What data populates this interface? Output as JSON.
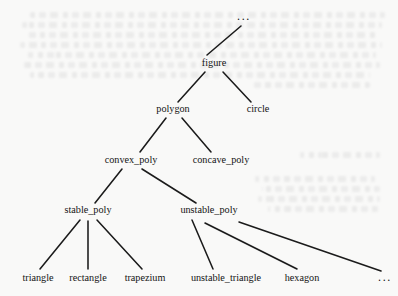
{
  "diagram": {
    "type": "tree",
    "background_color": "#f9f9f8",
    "edge_color": "#1b1b1b",
    "text_color": "#141414",
    "width": 398,
    "height": 296,
    "nodes": [
      {
        "id": "root_ellipsis",
        "label": "...",
        "x": 244,
        "y": 20,
        "level": 0,
        "is_ellipsis": true,
        "half_width": 9
      },
      {
        "id": "figure",
        "label": "figure",
        "x": 214,
        "y": 66,
        "level": 1,
        "is_ellipsis": false,
        "half_width": 17
      },
      {
        "id": "polygon",
        "label": "polygon",
        "x": 173,
        "y": 112,
        "level": 2,
        "is_ellipsis": false,
        "half_width": 22
      },
      {
        "id": "circle",
        "label": "circle",
        "x": 258,
        "y": 112,
        "level": 2,
        "is_ellipsis": false,
        "half_width": 16
      },
      {
        "id": "convex_poly",
        "label": "convex_poly",
        "x": 131,
        "y": 163,
        "level": 3,
        "is_ellipsis": false,
        "half_width": 32
      },
      {
        "id": "concave_poly",
        "label": "concave_poly",
        "x": 221,
        "y": 163,
        "level": 3,
        "is_ellipsis": false,
        "half_width": 34
      },
      {
        "id": "stable_poly",
        "label": "stable_poly",
        "x": 88,
        "y": 213,
        "level": 4,
        "is_ellipsis": false,
        "half_width": 29
      },
      {
        "id": "unstable_poly",
        "label": "unstable_poly",
        "x": 209,
        "y": 213,
        "level": 4,
        "is_ellipsis": false,
        "half_width": 34
      },
      {
        "id": "triangle",
        "label": "triangle",
        "x": 38,
        "y": 281,
        "level": 5,
        "is_ellipsis": false,
        "half_width": 20
      },
      {
        "id": "rectangle",
        "label": "rectangle",
        "x": 88,
        "y": 281,
        "level": 5,
        "is_ellipsis": false,
        "half_width": 24
      },
      {
        "id": "trapezium",
        "label": "trapezium",
        "x": 145,
        "y": 281,
        "level": 5,
        "is_ellipsis": false,
        "half_width": 24
      },
      {
        "id": "unstable_triangle",
        "label": "unstable_triangle",
        "x": 226,
        "y": 281,
        "level": 5,
        "is_ellipsis": false,
        "half_width": 42
      },
      {
        "id": "hexagon",
        "label": "hexagon",
        "x": 302,
        "y": 281,
        "level": 5,
        "is_ellipsis": false,
        "half_width": 22
      },
      {
        "id": "leaf_ellipsis",
        "label": "...",
        "x": 385,
        "y": 281,
        "level": 5,
        "is_ellipsis": true,
        "half_width": 9
      }
    ],
    "edges": [
      {
        "id": "edge-figure-root",
        "from": "figure",
        "to": "root_ellipsis",
        "x1": 207,
        "y1": 55,
        "x2": 241,
        "y2": 26
      },
      {
        "id": "edge-figure-polygon",
        "from": "figure",
        "to": "polygon",
        "x1": 205,
        "y1": 72,
        "x2": 178,
        "y2": 102
      },
      {
        "id": "edge-figure-circle",
        "from": "figure",
        "to": "circle",
        "x1": 223,
        "y1": 72,
        "x2": 251,
        "y2": 102
      },
      {
        "id": "edge-polygon-convex",
        "from": "polygon",
        "to": "convex_poly",
        "x1": 166,
        "y1": 118,
        "x2": 140,
        "y2": 152
      },
      {
        "id": "edge-polygon-concave",
        "from": "polygon",
        "to": "concave_poly",
        "x1": 182,
        "y1": 118,
        "x2": 211,
        "y2": 152
      },
      {
        "id": "edge-convex-stable",
        "from": "convex_poly",
        "to": "stable_poly",
        "x1": 122,
        "y1": 169,
        "x2": 95,
        "y2": 203
      },
      {
        "id": "edge-convex-unstable",
        "from": "convex_poly",
        "to": "unstable_poly",
        "x1": 142,
        "y1": 169,
        "x2": 196,
        "y2": 203
      },
      {
        "id": "edge-stable-triangle",
        "from": "stable_poly",
        "to": "triangle",
        "x1": 80,
        "y1": 220,
        "x2": 40,
        "y2": 269
      },
      {
        "id": "edge-stable-rectangle",
        "from": "stable_poly",
        "to": "rectangle",
        "x1": 88,
        "y1": 221,
        "x2": 88,
        "y2": 269
      },
      {
        "id": "edge-stable-trapezium",
        "from": "stable_poly",
        "to": "trapezium",
        "x1": 97,
        "y1": 220,
        "x2": 142,
        "y2": 269
      },
      {
        "id": "edge-unstable-unstabletriangle",
        "from": "unstable_poly",
        "to": "unstable_triangle",
        "x1": 192,
        "y1": 220,
        "x2": 213,
        "y2": 269
      },
      {
        "id": "edge-unstable-hexagon",
        "from": "unstable_poly",
        "to": "hexagon",
        "x1": 205,
        "y1": 223,
        "x2": 297,
        "y2": 269
      },
      {
        "id": "edge-unstable-leafellipsis",
        "from": "unstable_poly",
        "to": "leaf_ellipsis",
        "x1": 239,
        "y1": 222,
        "x2": 381,
        "y2": 271
      }
    ]
  },
  "bleed_through": {
    "description": "faint show-through text from reverse of scanned page",
    "lines": [
      {
        "x": 30,
        "y": 12,
        "w": 355
      },
      {
        "x": 22,
        "y": 22,
        "w": 360
      },
      {
        "x": 26,
        "y": 32,
        "w": 350
      },
      {
        "x": 20,
        "y": 42,
        "w": 362
      },
      {
        "x": 28,
        "y": 52,
        "w": 348
      },
      {
        "x": 24,
        "y": 62,
        "w": 356
      },
      {
        "x": 30,
        "y": 72,
        "w": 340
      },
      {
        "x": 250,
        "y": 82,
        "w": 120
      },
      {
        "x": 300,
        "y": 152,
        "w": 80
      },
      {
        "x": 255,
        "y": 176,
        "w": 120
      },
      {
        "x": 262,
        "y": 186,
        "w": 118
      },
      {
        "x": 258,
        "y": 196,
        "w": 122
      },
      {
        "x": 268,
        "y": 206,
        "w": 110
      }
    ]
  }
}
